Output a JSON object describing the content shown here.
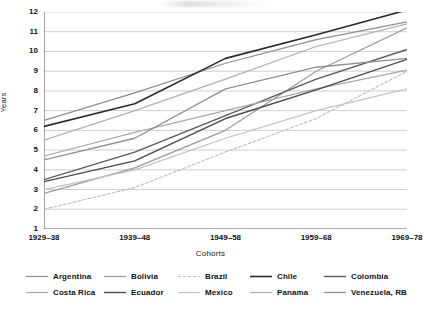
{
  "chart_data": {
    "type": "line",
    "title": "",
    "xlabel": "Cohorts",
    "ylabel": "Years",
    "categories": [
      "1929–38",
      "1939–48",
      "1949–58",
      "1959–68",
      "1969–78"
    ],
    "ylim": [
      1,
      12
    ],
    "y_ticks": [
      1,
      2,
      3,
      4,
      5,
      6,
      7,
      8,
      9,
      10,
      11,
      12
    ],
    "grid": true,
    "legend_position": "bottom",
    "series": [
      {
        "name": "Argentina",
        "values": [
          6.5,
          7.9,
          9.4,
          10.6,
          11.5
        ],
        "color": "#8e8e8e",
        "width": 1.2,
        "dash": ""
      },
      {
        "name": "Bolivia",
        "values": [
          2.8,
          4.1,
          6.0,
          9.0,
          11.2
        ],
        "color": "#9a9a9a",
        "width": 1.2,
        "dash": ""
      },
      {
        "name": "Brazil",
        "values": [
          2.0,
          3.1,
          4.9,
          6.6,
          9.0
        ],
        "color": "#bcbcbc",
        "width": 1.1,
        "dash": "3,2"
      },
      {
        "name": "Chile",
        "values": [
          6.2,
          7.35,
          9.65,
          10.85,
          12.1
        ],
        "color": "#2b2b2b",
        "width": 1.6,
        "dash": ""
      },
      {
        "name": "Colombia",
        "values": [
          3.5,
          4.9,
          6.75,
          8.6,
          10.1
        ],
        "color": "#5a5a5a",
        "width": 1.4,
        "dash": ""
      },
      {
        "name": "Costa Rica",
        "values": [
          4.7,
          5.9,
          7.0,
          8.1,
          9.05
        ],
        "color": "#a8a8a8",
        "width": 1.2,
        "dash": ""
      },
      {
        "name": "Ecuador",
        "values": [
          3.4,
          4.45,
          6.6,
          8.05,
          9.6
        ],
        "color": "#4a4a4a",
        "width": 1.4,
        "dash": ""
      },
      {
        "name": "Mexico",
        "values": [
          3.0,
          4.0,
          5.6,
          7.0,
          8.1
        ],
        "color": "#c2c2c2",
        "width": 1.2,
        "dash": ""
      },
      {
        "name": "Panama",
        "values": [
          5.5,
          7.0,
          8.6,
          10.25,
          11.4
        ],
        "color": "#b0b0b0",
        "width": 1.2,
        "dash": ""
      },
      {
        "name": "Venezuela, RB",
        "values": [
          4.5,
          5.6,
          8.1,
          9.2,
          9.65
        ],
        "color": "#909090",
        "width": 1.3,
        "dash": ""
      }
    ]
  },
  "axis": {
    "y_title": "Years",
    "x_title": "Cohorts"
  },
  "legend": {
    "rows": [
      [
        "Argentina",
        "Bolivia",
        "Brazil",
        "Chile",
        "Colombia"
      ],
      [
        "Costa Rica",
        "Ecuador",
        "Mexico",
        "Panama",
        "Venezuela, RB"
      ]
    ]
  }
}
